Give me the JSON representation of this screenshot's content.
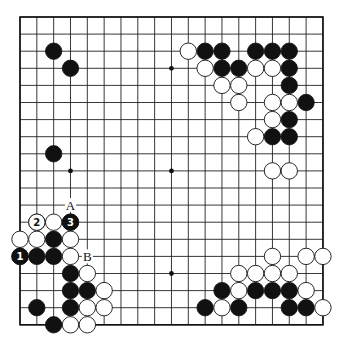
{
  "board": {
    "size": 19,
    "origin_x": 20,
    "origin_y": 17,
    "spacing_x": 16.83,
    "spacing_y": 17.1,
    "stone_radius": 8.2,
    "star_points": [
      [
        3,
        3
      ],
      [
        3,
        9
      ],
      [
        3,
        15
      ],
      [
        9,
        3
      ],
      [
        9,
        9
      ],
      [
        9,
        15
      ],
      [
        15,
        3
      ],
      [
        15,
        9
      ],
      [
        15,
        15
      ]
    ],
    "colors": {
      "line": "#222222",
      "black": "#111111",
      "white": "#ffffff"
    }
  },
  "stones": {
    "black": [
      [
        2,
        2
      ],
      [
        3,
        3
      ],
      [
        2,
        8
      ],
      [
        11,
        2
      ],
      [
        12,
        2
      ],
      [
        14,
        2
      ],
      [
        15,
        2
      ],
      [
        16,
        2
      ],
      [
        12,
        3
      ],
      [
        13,
        3
      ],
      [
        16,
        3
      ],
      [
        16,
        4
      ],
      [
        17,
        5
      ],
      [
        16,
        6
      ],
      [
        15,
        7
      ],
      [
        16,
        7
      ],
      [
        2,
        13
      ],
      [
        0,
        14
      ],
      [
        1,
        14
      ],
      [
        2,
        14
      ],
      [
        3,
        12
      ],
      [
        3,
        15
      ],
      [
        3,
        16
      ],
      [
        4,
        16
      ],
      [
        1,
        17
      ],
      [
        3,
        17
      ],
      [
        2,
        18
      ],
      [
        12,
        16
      ],
      [
        14,
        16
      ],
      [
        15,
        16
      ],
      [
        16,
        16
      ],
      [
        11,
        17
      ],
      [
        13,
        17
      ],
      [
        16,
        17
      ],
      [
        17,
        17
      ]
    ],
    "white": [
      [
        10,
        2
      ],
      [
        11,
        3
      ],
      [
        14,
        3
      ],
      [
        15,
        3
      ],
      [
        12,
        4
      ],
      [
        13,
        4
      ],
      [
        13,
        5
      ],
      [
        15,
        5
      ],
      [
        16,
        5
      ],
      [
        15,
        6
      ],
      [
        14,
        7
      ],
      [
        15,
        9
      ],
      [
        16,
        9
      ],
      [
        1,
        12
      ],
      [
        2,
        12
      ],
      [
        0,
        13
      ],
      [
        1,
        13
      ],
      [
        3,
        13
      ],
      [
        3,
        14
      ],
      [
        4,
        15
      ],
      [
        5,
        16
      ],
      [
        4,
        17
      ],
      [
        5,
        17
      ],
      [
        3,
        18
      ],
      [
        4,
        18
      ],
      [
        15,
        14
      ],
      [
        17,
        14
      ],
      [
        18,
        14
      ],
      [
        13,
        15
      ],
      [
        14,
        15
      ],
      [
        15,
        15
      ],
      [
        16,
        15
      ],
      [
        13,
        16
      ],
      [
        17,
        16
      ],
      [
        12,
        17
      ],
      [
        18,
        17
      ]
    ]
  },
  "numbered_moves": [
    {
      "number": "1",
      "color": "black",
      "col": 0,
      "row": 14
    },
    {
      "number": "2",
      "color": "white",
      "col": 1,
      "row": 12
    },
    {
      "number": "3",
      "color": "black",
      "col": 3,
      "row": 12
    }
  ],
  "labels": [
    {
      "text": "A",
      "col": 3,
      "row": 11
    },
    {
      "text": "B",
      "col": 4,
      "row": 14
    }
  ]
}
